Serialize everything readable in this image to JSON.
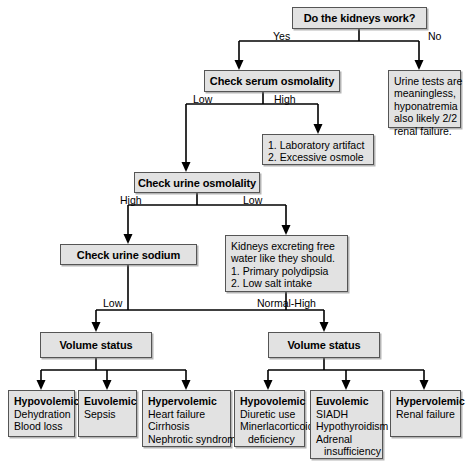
{
  "diagram": {
    "type": "flowchart",
    "accent_fill": "#e2e2e2",
    "border_color": "#555555",
    "text_color": "#000000",
    "background": "#ffffff"
  },
  "nodes": {
    "root": {
      "label": "Do the kidneys work?"
    },
    "serum_osm": {
      "label": "Check serum osmolality"
    },
    "urine_useless": {
      "lines": [
        "Urine tests are",
        "meaningless,",
        "hyponatremia",
        "also likely 2/2",
        "renal failure."
      ]
    },
    "lab_artifact": {
      "lines": [
        "1. Laboratory artifact",
        "2. Excessive osmole"
      ]
    },
    "urine_osm": {
      "label": "Check urine osmolality"
    },
    "urine_sodium": {
      "label": "Check urine sodium"
    },
    "free_water": {
      "lines": [
        "Kidneys excreting free",
        "water like they should.",
        "1. Primary polydipsia",
        "2. Low salt intake"
      ]
    },
    "volume_status_left": {
      "label": "Volume status"
    },
    "volume_status_right": {
      "label": "Volume status"
    },
    "hypo_left": {
      "header": "Hypovolemic",
      "lines": [
        "Dehydration",
        "Blood loss"
      ]
    },
    "eu_left": {
      "header": "Euvolemic",
      "lines": [
        "Sepsis"
      ]
    },
    "hyper_left": {
      "header": "Hypervolemic",
      "lines": [
        "Heart failure",
        "Cirrhosis",
        "Nephrotic syndrome"
      ]
    },
    "hypo_right": {
      "header": "Hypovolemic",
      "lines": [
        "Diuretic use",
        "Minerlacorticoid",
        "deficiency"
      ],
      "indent_last": true
    },
    "eu_right": {
      "header": "Euvolemic",
      "lines": [
        "SIADH",
        "Hypothyroidism",
        "Adrenal",
        "insufficiency"
      ],
      "indent_last": true
    },
    "hyper_right": {
      "header": "Hypervolemic",
      "lines": [
        "Renal failure"
      ]
    }
  },
  "edge_labels": {
    "yes": "Yes",
    "no": "No",
    "serum_low": "Low",
    "serum_high": "High",
    "urine_high": "High",
    "urine_low": "Low",
    "sodium_low": "Low",
    "sodium_normal_high": "Normal-High"
  }
}
